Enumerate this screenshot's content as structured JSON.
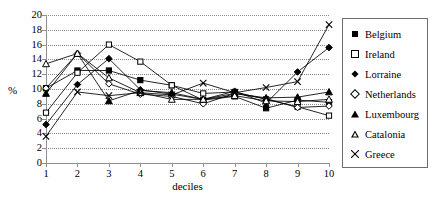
{
  "chart_data": {
    "type": "line",
    "title": "",
    "xlabel": "deciles",
    "ylabel": "%",
    "categories": [
      1,
      2,
      3,
      4,
      5,
      6,
      7,
      8,
      9,
      10
    ],
    "x": [
      1,
      2,
      3,
      4,
      5,
      6,
      7,
      8,
      9,
      10
    ],
    "xlim": [
      1,
      10
    ],
    "ylim": [
      0,
      20
    ],
    "y_ticks": [
      0,
      2,
      4,
      6,
      8,
      10,
      12,
      14,
      16,
      18,
      20
    ],
    "x_ticks": [
      1,
      2,
      3,
      4,
      5,
      6,
      7,
      8,
      9,
      10
    ],
    "grid": "horizontal-dotted",
    "legend_position": "right",
    "series": [
      {
        "name": "Belgium",
        "marker": "filled-square",
        "values": [
          10.1,
          12.5,
          12.5,
          11.2,
          10.5,
          8.5,
          9.0,
          7.4,
          8.5,
          8.2
        ]
      },
      {
        "name": "Ireland",
        "marker": "open-square",
        "values": [
          6.8,
          12.2,
          16.0,
          13.7,
          10.5,
          9.4,
          9.6,
          8.6,
          7.6,
          6.4
        ]
      },
      {
        "name": "Lorraine",
        "marker": "filled-diamond",
        "values": [
          5.2,
          10.6,
          14.1,
          9.9,
          9.3,
          8.6,
          9.7,
          8.1,
          12.3,
          15.6
        ]
      },
      {
        "name": "Netherlands",
        "marker": "open-diamond",
        "values": [
          10.1,
          14.8,
          10.7,
          9.3,
          9.0,
          8.0,
          9.4,
          8.7,
          7.5,
          7.7
        ]
      },
      {
        "name": "Luxembourg",
        "marker": "filled-triangle",
        "values": [
          9.4,
          14.8,
          8.4,
          9.8,
          9.5,
          8.6,
          9.4,
          8.8,
          8.9,
          9.6
        ]
      },
      {
        "name": "Catalonia",
        "marker": "open-triangle",
        "values": [
          13.4,
          14.8,
          11.5,
          9.5,
          8.6,
          8.6,
          9.1,
          8.4,
          8.3,
          8.6
        ]
      },
      {
        "name": "Greece",
        "marker": "cross-x",
        "values": [
          3.6,
          9.6,
          9.1,
          9.5,
          9.2,
          10.8,
          9.5,
          10.2,
          11.0,
          18.7
        ]
      }
    ]
  },
  "axes": {
    "y_label": "%",
    "x_label": "deciles"
  },
  "legend": {
    "items": [
      {
        "label": "Belgium",
        "marker": "filled-square"
      },
      {
        "label": "Ireland",
        "marker": "open-square"
      },
      {
        "label": "Lorraine",
        "marker": "filled-diamond"
      },
      {
        "label": "Netherlands",
        "marker": "open-diamond"
      },
      {
        "label": "Luxembourg",
        "marker": "filled-triangle"
      },
      {
        "label": "Catalonia",
        "marker": "open-triangle"
      },
      {
        "label": "Greece",
        "marker": "cross-x"
      }
    ]
  },
  "colors": {
    "line": "#000000",
    "grid": "#8a8a8a",
    "axis": "#8f8f8f",
    "background": "#ffffff"
  }
}
